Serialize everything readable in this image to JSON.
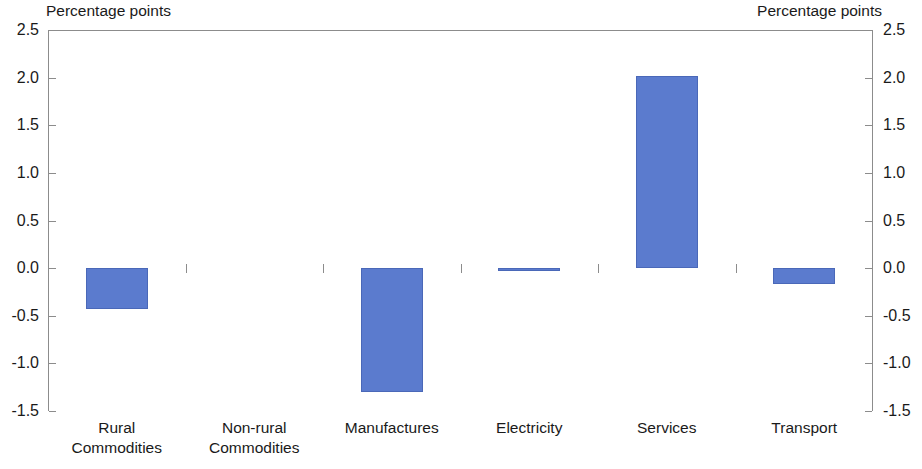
{
  "axis_caption_left": "Percentage points",
  "axis_caption_right": "Percentage points",
  "chart_data": {
    "type": "bar",
    "title": "",
    "subtitle": "",
    "xlabel": "",
    "ylabel": "Percentage points",
    "ylabel_right": "Percentage points",
    "ylim": [
      -1.5,
      2.5
    ],
    "ytick_step": 0.5,
    "yticks": [
      2.5,
      2.0,
      1.5,
      1.0,
      0.5,
      0.0,
      -0.5,
      -1.0,
      -1.5
    ],
    "ytick_labels": [
      "2.5",
      "2.0",
      "1.5",
      "1.0",
      "0.5",
      "0.0",
      "-0.5",
      "-1.0",
      "-1.5"
    ],
    "grid": false,
    "legend": false,
    "legend_position": "none",
    "bar_color": "#5b7bce",
    "axis_color": "#8c8c8c",
    "zero_line": 0.0,
    "categories": [
      "Rural\nCommodities",
      "Non-rural\nCommodities",
      "Manufactures",
      "Electricity",
      "Services",
      "Transport"
    ],
    "category_lines": [
      [
        "Rural",
        "Commodities"
      ],
      [
        "Non-rural",
        "Commodities"
      ],
      [
        "Manufactures",
        ""
      ],
      [
        "Electricity",
        ""
      ],
      [
        "Services",
        ""
      ],
      [
        "Transport",
        ""
      ]
    ],
    "values": [
      -0.43,
      0.0,
      -1.3,
      -0.03,
      2.02,
      -0.17
    ]
  }
}
